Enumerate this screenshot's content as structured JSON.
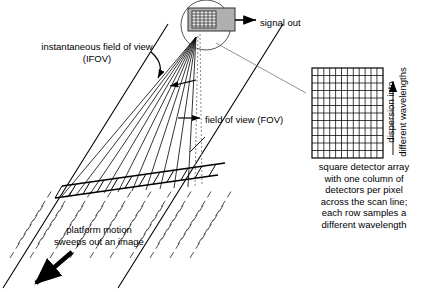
{
  "figure": {
    "background_color": "#ffffff",
    "line_color": "#000000",
    "sensor_body_color": "#b0b0b0",
    "width": 438,
    "height": 292
  },
  "labels": {
    "ifov": "instantaneous field of view\n(IFOV)",
    "fov": "field of view (FOV)",
    "signal_out": "signal out",
    "platform_motion": "platform motion\nsweeps out an image",
    "dispersion": "dispersion into\ndifferent wavelengths",
    "array_caption": "square detector array\nwith one column of\ndetectors per pixel\nacross the scan line;\neach row samples a\ndifferent wavelength"
  },
  "detector_array": {
    "rows": 12,
    "columns": 12,
    "x": 312,
    "y": 68,
    "width": 71,
    "height": 90
  },
  "sensor": {
    "box_x": 188,
    "box_y": 8,
    "box_width": 47,
    "box_height": 23,
    "mini_array_rows": 6,
    "mini_array_columns": 7,
    "magnifier_circle_cx": 206,
    "magnifier_circle_cy": 25,
    "magnifier_circle_r": 25
  },
  "ray_fan": {
    "origin_x": 196,
    "origin_y": 37,
    "ray_count": 12,
    "description": "rays from sensor to ground scan line"
  },
  "ground_plane": {
    "description": "parallelogram ground swath with scan-line band",
    "scan_band_cells": 12
  }
}
